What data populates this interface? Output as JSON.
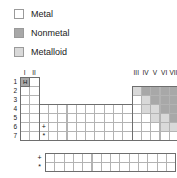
{
  "legend": {
    "items": [
      {
        "label": "Metal",
        "swatch_name": "metal-swatch",
        "color": "#ffffff"
      },
      {
        "label": "Nonmetal",
        "swatch_name": "nonmetal-swatch",
        "color": "#a8a8a8"
      },
      {
        "label": "Metalloid",
        "swatch_name": "metalloid-swatch",
        "color": "#d9d9d9"
      }
    ]
  },
  "periodic_table": {
    "group_labels_left": [
      "I",
      "II"
    ],
    "group_labels_right": [
      "III",
      "IV",
      "V",
      "VI",
      "VII",
      "0"
    ],
    "period_labels": [
      "1",
      "2",
      "3",
      "4",
      "5",
      "6",
      "7"
    ],
    "hydrogen_symbol": "H",
    "lanthanide_marker": "+",
    "actinide_marker": "*",
    "inner_block_rows": 2,
    "inner_block_columns": 14,
    "colors": {
      "metal": "#ffffff",
      "nonmetal": "#a8a8a8",
      "metalloid": "#d9d9d9",
      "grid_line": "#b3b3b3",
      "outline": "#6e6e6e"
    }
  }
}
